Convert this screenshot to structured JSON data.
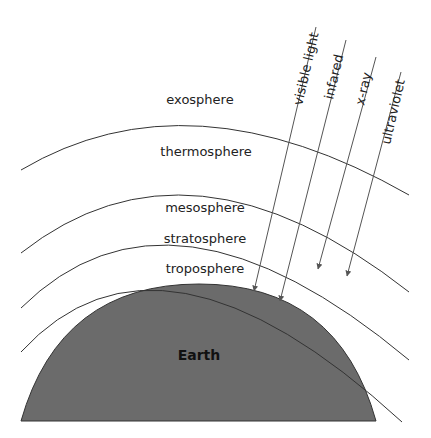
{
  "diagram": {
    "layers": [
      {
        "label": "exosphere"
      },
      {
        "label": "thermosphere"
      },
      {
        "label": "mesosphere"
      },
      {
        "label": "stratosphere"
      },
      {
        "label": "troposphere"
      }
    ],
    "planet": {
      "label": "Earth",
      "fill": "#6b6b6b"
    },
    "radiation": [
      {
        "label": "visible light",
        "reaches": "Earth surface"
      },
      {
        "label": "infared",
        "reaches": "Earth surface"
      },
      {
        "label": "x-ray",
        "reaches": "stratosphere"
      },
      {
        "label": "ultraviolet",
        "reaches": "stratosphere"
      }
    ],
    "colors": {
      "line": "#333333",
      "arrow": "#555555",
      "earth": "#6b6b6b"
    }
  }
}
